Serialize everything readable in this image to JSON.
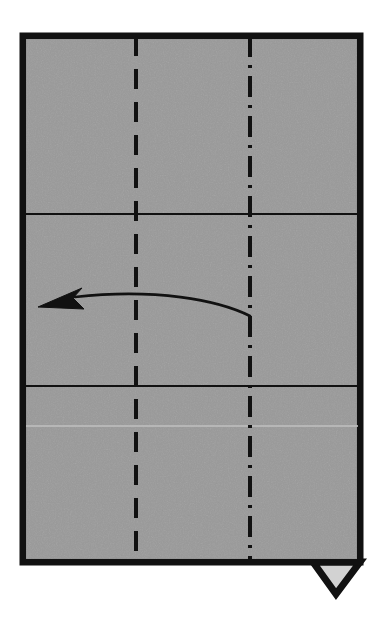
{
  "diagram": {
    "type": "origami-step",
    "description": "Rectangular sheet of paper shown front side up with existing crease lines and a curved valley-fold arrow pointing left",
    "canvas": {
      "width": 383,
      "height": 618,
      "background_color": "#ffffff"
    },
    "paper": {
      "label": "paper-sheet",
      "fill_color": "#9a9a9a",
      "stroke_color": "#111111",
      "stroke_width": 7,
      "x": 23,
      "y": 36,
      "width": 337,
      "height": 526
    },
    "flap": {
      "label": "bottom-right-flap",
      "shape": "triangle",
      "fill_color": "#d2d2d2",
      "stroke_color": "#111111",
      "stroke_width": 7,
      "points": "313,562 360,562 336,594"
    },
    "creases": [
      {
        "name": "vertical-valley-crease",
        "style": "dashed",
        "orientation": "vertical",
        "x": 136,
        "y1": 36,
        "y2": 562,
        "stroke_color": "#111111",
        "stroke_width": 4,
        "dash_pattern": "20 13"
      },
      {
        "name": "vertical-mountain-crease",
        "style": "dash-dot",
        "orientation": "vertical",
        "x": 250,
        "y1": 36,
        "y2": 562,
        "stroke_color": "#111111",
        "stroke_width": 4,
        "dash_pattern": "21 8 3 8"
      },
      {
        "name": "upper-horizontal-crease",
        "style": "solid",
        "orientation": "horizontal",
        "y": 214,
        "x1": 26,
        "x2": 358,
        "stroke_color": "#111111",
        "stroke_width": 2
      },
      {
        "name": "lower-horizontal-crease",
        "style": "solid",
        "orientation": "horizontal",
        "y": 386,
        "x1": 26,
        "x2": 358,
        "stroke_color": "#111111",
        "stroke_width": 2
      },
      {
        "name": "faint-scan-line",
        "style": "solid-faint",
        "orientation": "horizontal",
        "y": 426,
        "x1": 26,
        "x2": 358,
        "stroke_color": "#bcbcbc",
        "stroke_width": 2
      }
    ],
    "arrow": {
      "name": "fold-direction-arrow",
      "direction": "right-to-left",
      "stroke_color": "#111111",
      "stroke_width": 2.6,
      "fill_color": "#111111",
      "path": "M 250,316 C 218,300 155,288 75,297",
      "head_points": "38,307 82,288 73,298 84,309",
      "tail_x": 250,
      "tail_y": 316,
      "tip_x": 38,
      "tip_y": 307
    }
  }
}
